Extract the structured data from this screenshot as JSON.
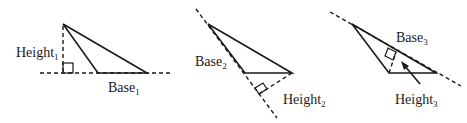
{
  "diagram": {
    "title": "",
    "panels": [
      {
        "id": "triangle-1",
        "height_label": "Height",
        "height_sub": "1",
        "base_label": "Base",
        "base_sub": "1"
      },
      {
        "id": "triangle-2",
        "base_label": "Base",
        "base_sub": "2",
        "height_label": "Height",
        "height_sub": "2"
      },
      {
        "id": "triangle-3",
        "base_label": "Base",
        "base_sub": "3",
        "height_label": "Height",
        "height_sub": "3"
      }
    ],
    "colors": {
      "stroke": "#1a1a1a",
      "background": "#ffffff"
    }
  }
}
